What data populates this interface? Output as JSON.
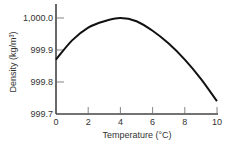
{
  "chart_data": {
    "type": "line",
    "title": "",
    "xlabel": "Temperature (°C)",
    "ylabel": "Density (kg/m³)",
    "xlim": [
      0,
      10
    ],
    "ylim": [
      999.7,
      1000.0
    ],
    "x_ticks": [
      "0",
      "2",
      "4",
      "6",
      "8",
      "10"
    ],
    "y_ticks": [
      "999.7",
      "999.8",
      "999.9",
      "1,000.0"
    ],
    "grid": false,
    "legend": null,
    "series": [
      {
        "name": "Density of water",
        "x": [
          0,
          1,
          2,
          3,
          4,
          5,
          6,
          7,
          8,
          9,
          10
        ],
        "values": [
          999.87,
          999.93,
          999.97,
          999.99,
          1000.0,
          999.99,
          999.96,
          999.92,
          999.87,
          999.81,
          999.74
        ]
      }
    ]
  },
  "labels": {
    "xlabel": "Temperature (°C)",
    "ylabel": "Density (kg/m³)"
  }
}
